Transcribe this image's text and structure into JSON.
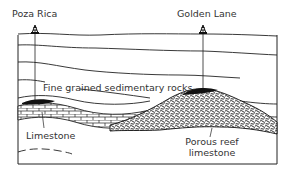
{
  "labels": {
    "well_left": "Poza Rica",
    "well_right": "Golden Lane",
    "sedimentary": "Fine grained sedimentary rocks",
    "limestone": "Limestone",
    "reef_line1": "Porous reef",
    "reef_line2": "limestone"
  },
  "icons": {
    "well_left": "oil-derrick",
    "well_right": "oil-derrick"
  },
  "colors": {
    "line": "#222222",
    "text": "#333333",
    "oil": "#111111",
    "background": "#ffffff"
  }
}
